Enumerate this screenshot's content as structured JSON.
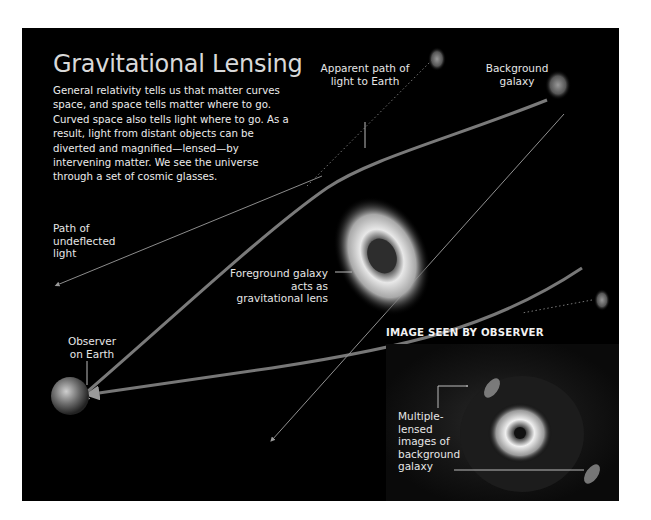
{
  "title": "Gravitational Lensing",
  "intro": "General relativity tells us that matter curves space, and space tells matter where to go. Curved space also tells light where to go. As a result, light from distant objects can be diverted and magnified—lensed—by intervening matter. We see the universe through a set of cosmic glasses.",
  "labels": {
    "apparent_path": "Apparent path of light to Earth",
    "background_galaxy": "Background galaxy",
    "undeflected": "Path of undeflected light",
    "foreground": "Foreground galaxy acts as gravitational lens",
    "observer": "Observer on Earth",
    "image_seen": "IMAGE SEEN BY OBSERVER",
    "multiple": "Multiple-lensed images of background galaxy"
  },
  "colors": {
    "background": "#000000",
    "text": "#e6e6e6",
    "light_path": "#8a8a8a",
    "galaxy": "#d8d8d8"
  }
}
